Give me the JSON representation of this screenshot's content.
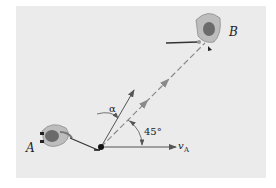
{
  "figure": {
    "labels": {
      "point_a": "A",
      "point_b": "B",
      "alpha": "α",
      "angle": "45°",
      "velocity_main": "v",
      "velocity_sub": "A"
    },
    "colors": {
      "background": "#ebebeb",
      "line": "#555555",
      "dashed": "#8a8a8a",
      "player_body": "#bdbdbd",
      "helmet": "#6b6b6b"
    }
  }
}
